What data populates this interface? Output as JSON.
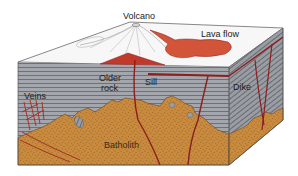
{
  "diagram": {
    "labels": {
      "volcano": "Volcano",
      "lava_flow": "Lava flow",
      "older_rock_1": "Older",
      "older_rock_2": "rock",
      "sill": "Sill",
      "veins": "Veins",
      "dike": "Dike",
      "batholith": "Batholith"
    },
    "colors": {
      "top_surface": "#f7f7f7",
      "older_rock": "#9ea2a8",
      "rock_lines": "#5f6368",
      "batholith": "#c98a3c",
      "batholith_speckle": "#6b4420",
      "magma": "#c0392b",
      "lava": "#d2553a",
      "intrusion_line": "#8b1e1e"
    }
  }
}
